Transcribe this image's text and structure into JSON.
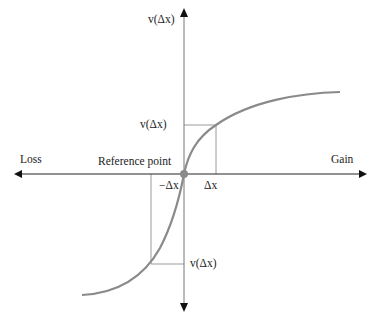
{
  "diagram": {
    "y_axis_label": "v(Δx)",
    "x_left_label": "Loss",
    "x_right_label": "Gain",
    "origin_label": "Reference point",
    "gain_x_label": "Δx",
    "loss_x_label": "−Δx",
    "gain_value_label": "v(Δx)",
    "loss_value_label": "v(Δx)",
    "colors": {
      "curve": "#8a8a8a",
      "axis": "#222222",
      "guide": "#9a9a9a",
      "origin_dot": "#8a8a8a"
    }
  }
}
